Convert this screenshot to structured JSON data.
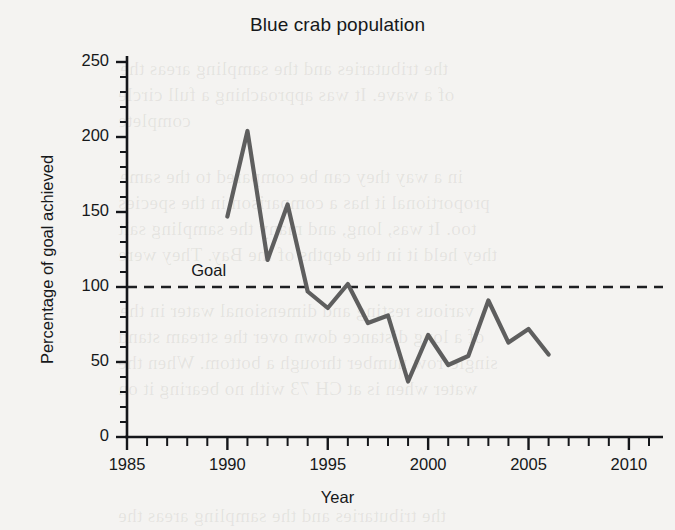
{
  "chart_data": {
    "type": "line",
    "title": "Blue crab population",
    "xlabel": "Year",
    "ylabel": "Percentage of goal achieved",
    "xlim": [
      1985,
      2011.3
    ],
    "ylim": [
      0,
      258
    ],
    "grid": false,
    "legend": "none",
    "x": [
      1990,
      1991,
      1992,
      1993,
      1994,
      1995,
      1996,
      1997,
      1998,
      1999,
      2000,
      2001,
      2002,
      2003,
      2004,
      2005,
      2006
    ],
    "values": [
      147,
      204,
      118,
      155,
      97,
      86,
      102,
      76,
      81,
      37,
      68,
      48,
      54,
      91,
      63,
      72,
      55
    ],
    "series": [
      {
        "name": "Percentage of goal achieved",
        "values": [
          147,
          204,
          118,
          155,
          97,
          86,
          102,
          76,
          81,
          37,
          68,
          48,
          54,
          91,
          63,
          72,
          55
        ]
      }
    ],
    "xticks_major": [
      1985,
      1990,
      1995,
      2000,
      2005,
      2010
    ],
    "xticklabels": [
      "1985",
      "1990",
      "1995",
      "2000",
      "2005",
      "2010"
    ],
    "xtick_minor_step": 1,
    "yticks_major": [
      0,
      50,
      100,
      150,
      200,
      250
    ],
    "yticklabels": [
      "0",
      "50",
      "100",
      "150",
      "200",
      "250"
    ],
    "ytick_minor_step": 10,
    "annotations": [
      {
        "name": "goal-line",
        "label": "Goal",
        "type": "horizontal-dashed-line",
        "y": 100
      }
    ],
    "colors": {
      "line": "#5e5e5e",
      "axis": "#14161a",
      "text": "#16181a",
      "background": "#f4f3f1",
      "goal_line": "#1d1f22"
    }
  },
  "background_bleed": {
    "lines": [
      "the tributaries and the sampling areas the",
      "of a wave. It was approaching a full circle",
      "complete",
      "in a way they can be compared to the same",
      "proportional it has a comparison in the species",
      "too. It was, long, and many the sampling salt",
      "they held it in the depths of the Bay. They were",
      "various resting and dimensional water in the",
      "of a long distance down over the stream stand",
      "single-row number through a bottom. When the",
      "water when is at CH 73 with no bearing it on"
    ]
  }
}
